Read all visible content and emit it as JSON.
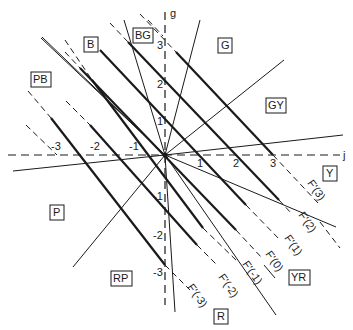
{
  "axes": {
    "horizontal_label": "j",
    "vertical_label": "g",
    "horizontal_ticks": [
      "-3",
      "-2",
      "-1",
      "1",
      "2",
      "3"
    ],
    "vertical_ticks": [
      "3",
      "2",
      "1",
      "-1",
      "-2",
      "-3"
    ]
  },
  "hue_regions": [
    {
      "id": "B",
      "label": "B"
    },
    {
      "id": "BG",
      "label": "BG"
    },
    {
      "id": "G",
      "label": "G"
    },
    {
      "id": "PB",
      "label": "PB"
    },
    {
      "id": "GY",
      "label": "GY"
    },
    {
      "id": "Y",
      "label": "Y"
    },
    {
      "id": "P",
      "label": "P"
    },
    {
      "id": "RP",
      "label": "RP"
    },
    {
      "id": "YR",
      "label": "YR"
    },
    {
      "id": "R",
      "label": "R"
    }
  ],
  "f_lines": [
    {
      "label": "F'(3)"
    },
    {
      "label": "F'(2)"
    },
    {
      "label": "F'(1)"
    },
    {
      "label": "F'(0)"
    },
    {
      "label": "F'(-1)"
    },
    {
      "label": "F'(-2)"
    },
    {
      "label": "F'(-3)"
    }
  ]
}
